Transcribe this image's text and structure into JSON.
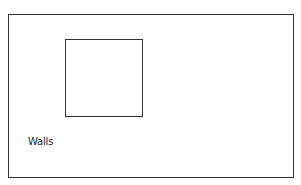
{
  "diagram": {
    "shapes": [
      {
        "id": "outer-room",
        "type": "rectangle",
        "role": "outer boundary"
      },
      {
        "id": "inner-square",
        "type": "square",
        "role": "inner element"
      }
    ],
    "labels": {
      "walls": "Walls"
    },
    "colors": {
      "stroke": "#333333",
      "text": "#222222",
      "background": "#ffffff"
    }
  }
}
